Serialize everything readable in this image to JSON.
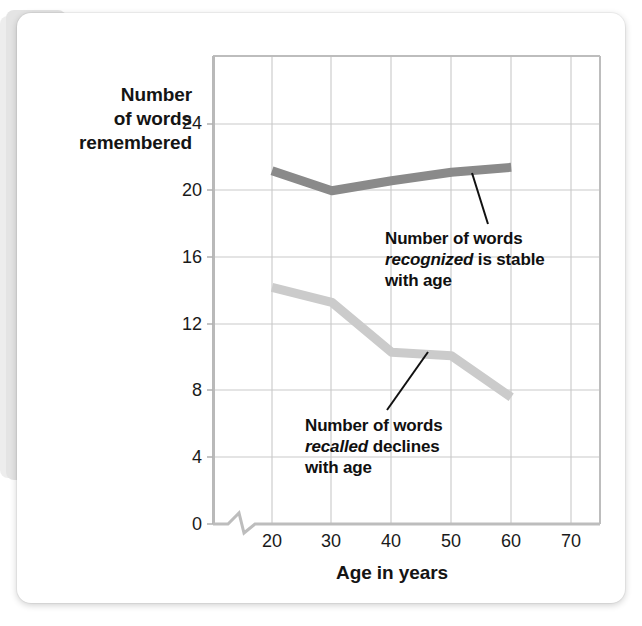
{
  "figure": {
    "card_background": "#ffffff",
    "page_background": "#ffffff"
  },
  "axes": {
    "y_title_line1": "Number",
    "y_title_line2": "of words",
    "y_title_line3": "remembered",
    "x_title": "Age in years",
    "y_ticks": [
      "0",
      "4",
      "8",
      "12",
      "16",
      "20",
      "24"
    ],
    "x_ticks": [
      "20",
      "30",
      "40",
      "50",
      "60",
      "70"
    ],
    "axis_break": "zigzag-break"
  },
  "annotations": {
    "recognized": {
      "line1": "Number of words",
      "emphasis": "recognized",
      "line2_rest": " is stable",
      "line3": "with age"
    },
    "recalled": {
      "line1": "Number of words",
      "emphasis": "recalled",
      "line2_rest": " declines",
      "line3": "with age"
    }
  },
  "colors": {
    "recognized_line": "#8a8a8a",
    "recalled_line": "#cbcbcb",
    "gridline": "#c9c9c9",
    "axis": "#b9b9b9",
    "leader": "#111111",
    "text": "#141414"
  },
  "chart_data": {
    "type": "line",
    "title": "",
    "xlabel": "Age in years",
    "ylabel": "Number of words remembered",
    "x": [
      20,
      30,
      40,
      50,
      60
    ],
    "xlim": [
      15,
      70
    ],
    "ylim": [
      0,
      26
    ],
    "xticks": [
      20,
      30,
      40,
      50,
      60,
      70
    ],
    "yticks": [
      0,
      4,
      8,
      12,
      16,
      20,
      24
    ],
    "grid": true,
    "legend": "none (inline annotations)",
    "axis_break_on_x": true,
    "series": [
      {
        "name": "Number of words recognized",
        "color": "#8a8a8a",
        "values": [
          21.2,
          20.0,
          20.6,
          21.1,
          21.4
        ],
        "note": "recognized is stable with age"
      },
      {
        "name": "Number of words recalled",
        "color": "#cbcbcb",
        "values": [
          14.2,
          13.3,
          10.3,
          10.1,
          7.6
        ],
        "note": "recalled declines with age"
      }
    ]
  }
}
